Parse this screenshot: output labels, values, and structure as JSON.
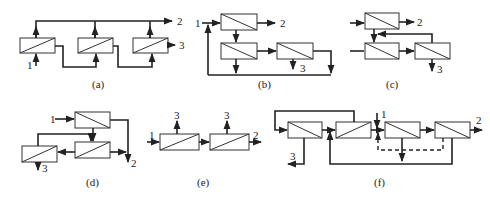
{
  "figure": {
    "panels": [
      {
        "id": "a",
        "caption": "(a)",
        "labels": {
          "feed": "1",
          "permeate": "2",
          "retentate": "3"
        }
      },
      {
        "id": "b",
        "caption": "(b)",
        "labels": {
          "feed": "1",
          "permeate": "2",
          "retentate": "3"
        }
      },
      {
        "id": "c",
        "caption": "(c)",
        "labels": {
          "feed": "1",
          "permeate": "2",
          "retentate": "3"
        }
      },
      {
        "id": "d",
        "caption": "(d)",
        "labels": {
          "feed": "1",
          "permeate": "2",
          "retentate": "3"
        }
      },
      {
        "id": "e",
        "caption": "(e)",
        "labels": {
          "feed": "1",
          "permeate": "2",
          "retentate_1": "3",
          "retentate_2": "3"
        }
      },
      {
        "id": "f",
        "caption": "(f)",
        "labels": {
          "feed": "1",
          "permeate": "2",
          "retentate": "3"
        }
      }
    ]
  }
}
